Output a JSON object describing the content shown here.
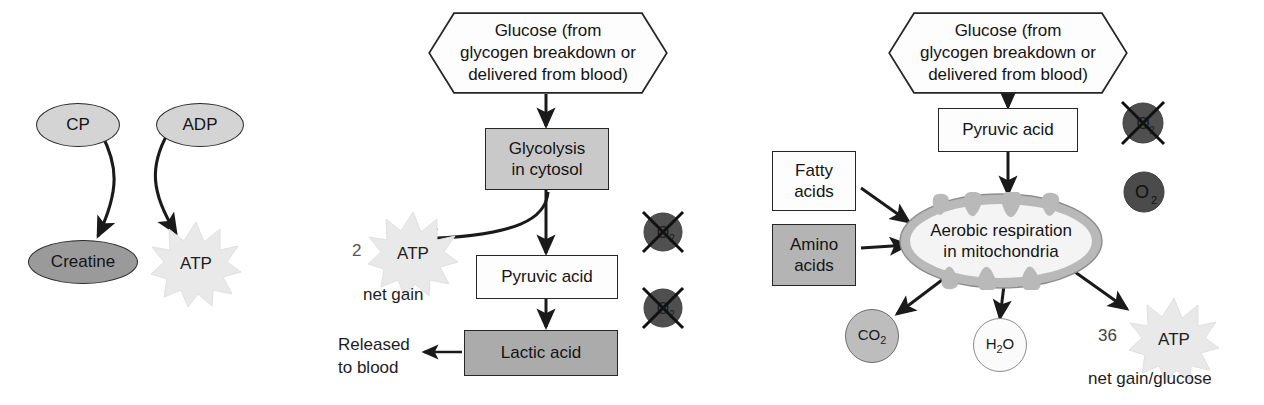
{
  "diagram": {
    "colors": {
      "ink": "#1d1d1d",
      "box_white": "#fdfdfd",
      "box_light_gray": "#c9c9c9",
      "box_mid_gray": "#ababab",
      "ellipse_light": "#d4d4d4",
      "ellipse_dark": "#9a9a9a",
      "o2_dark": "#4a4a4a",
      "co2_gray": "#bdbdbd",
      "atp_burst": "#e8e8e8"
    }
  },
  "panel_cp": {
    "name": "Creatine phosphate pathway",
    "cp_label": "CP",
    "adp_label": "ADP",
    "creatine_label": "Creatine",
    "atp_label": "ATP"
  },
  "panel_anaerobic": {
    "name": "Anaerobic glycolysis pathway",
    "glucose_label": "Glucose (from\nglycogen breakdown or\ndelivered from blood)",
    "glycolysis_label": "Glycolysis\nin cytosol",
    "pyruvic_acid_label": "Pyruvic acid",
    "lactic_acid_label": "Lactic acid",
    "atp_count": "2",
    "atp_label": "ATP",
    "net_gain_label": "net gain",
    "released_label": "Released\nto blood",
    "o2_label": "O",
    "o2_subscript": "2",
    "no_oxygen_markers": 2
  },
  "panel_aerobic": {
    "name": "Aerobic respiration pathway",
    "glucose_label": "Glucose (from\nglycogen breakdown or\ndelivered from blood)",
    "pyruvic_acid_label": "Pyruvic acid",
    "fatty_acids_label": "Fatty\nacids",
    "amino_acids_label": "Amino\nacids",
    "mitochondria_label": "Aerobic respiration\nin mitochondria",
    "co2_label": "CO",
    "co2_subscript": "2",
    "h2o_label_1": "H",
    "h2o_subscript": "2",
    "h2o_label_2": "O",
    "atp_count": "36",
    "atp_label": "ATP",
    "net_gain_label": "net gain/glucose",
    "o2_label": "O",
    "o2_subscript": "2",
    "o2_crossed_out": true,
    "o2_available": true
  }
}
